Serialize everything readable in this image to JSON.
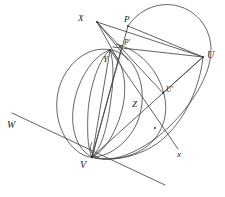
{
  "figure": {
    "background_color": "#ffffff",
    "stroke_color": "#3a3a3a",
    "label_color": "#1c1c1c"
  },
  "labels": {
    "x_upper": "X",
    "p": "P",
    "p_prime": "P′",
    "y": "Y",
    "u": "U",
    "u_prime": "U′",
    "z": "Z",
    "v": "V",
    "w": "W",
    "x_lower": "x"
  },
  "points": [
    {
      "name": "X",
      "label": "X",
      "cx": 97,
      "cy": 22
    },
    {
      "name": "P",
      "label": "P",
      "cx": 128,
      "cy": 26
    },
    {
      "name": "P'",
      "label": "P′",
      "cx": 122,
      "cy": 46
    },
    {
      "name": "Y",
      "label": "Y",
      "cx": 110,
      "cy": 50
    },
    {
      "name": "U",
      "label": "U",
      "cx": 203,
      "cy": 57
    },
    {
      "name": "U'",
      "label": "U′",
      "cx": 163,
      "cy": 93
    },
    {
      "name": "Z",
      "label": "Z",
      "cx": 139,
      "cy": 103
    },
    {
      "name": "V",
      "label": "V",
      "cx": 92,
      "cy": 157
    }
  ],
  "lines": [
    {
      "name": "line-W-x",
      "label": "W",
      "from": [
        12,
        113
      ],
      "to": [
        165,
        185
      ]
    },
    {
      "name": "line-x",
      "label": "x",
      "from": [
        110,
        50
      ],
      "to": [
        178,
        149
      ]
    }
  ]
}
